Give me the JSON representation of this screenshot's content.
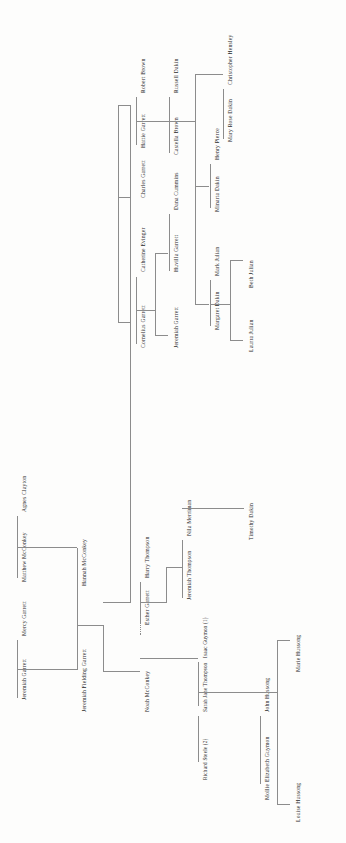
{
  "diagram": {
    "type": "genealogy-family-tree",
    "orientation": "rotated-90-ccw",
    "background_color": "#fdfdfc",
    "line_color": "#8c8c8c",
    "text_color": "#2b2b2b"
  },
  "people": {
    "jeremiah_garrett_sr": "Jeremiah Garrett",
    "mercy_garrett": "Mercy Garrett",
    "matthew_mcconkey": "Matthew  McConkey",
    "agnes_clayton": "Agnes Clayton",
    "jeremiah_fielding_garrett": "Jeremiah Fielding Garrett",
    "hannah_mcconkey": "Hannah McConkey",
    "noah_mcconkey": "Noah McConkey",
    "esther_garrett": "Esther Garrett",
    "harry_thompson": "Harry Thompson",
    "jeremiah_thompson": "Jeremiah Thompson",
    "nila_merriman": "Nila Merriman",
    "timothy_dakin": "Timothy Dakin",
    "richard_steele": "Richard Steele (2)",
    "sarah_jane_thompson": "Sarah Jane Thompson",
    "isaac_guymon": "Isaac Guymon (1)",
    "mollie_elizabeth_guymon": "Mollie Elizabeth Guymon",
    "john_hussong": "John Hussong",
    "louise_hussong": "Louise Hussong",
    "marie_hussong": "Marie Hussong",
    "cornelius_garrett": "Cornelius Garrett",
    "catherine_evinger": "Catherine Evinger",
    "charles_garrett": "Charles Garrett",
    "hattie_garrett": "Hattie Garrett",
    "robert_brown": "Robert Brown",
    "jeremiah_garrett_jr": "Jeremiah Garrett",
    "huvilla_garrett": "Huvilla Garrett",
    "dana_cummins": "Dana Cummins",
    "castella_brown": "Castella Brown",
    "russell_dakin": "Russell Dakin",
    "margaret_dakin": "Margaret Dakin",
    "mark_julian": "Mark Julian",
    "minarta_dakin": "Minarta Dakin",
    "henry_pierce": "Henry Pierce",
    "mary_rose_dakin": "Mary Rose Dakin",
    "christopher_hensley": "Christopher Hensley",
    "laurra_julian": "Laurra Julian",
    "beth_julian": "Beth Julian"
  },
  "unions": [
    {
      "a": "jeremiah_garrett_sr",
      "b": "mercy_garrett",
      "child": "jeremiah_fielding_garrett"
    },
    {
      "a": "matthew_mcconkey",
      "b": "agnes_clayton",
      "child": "hannah_mcconkey"
    },
    {
      "a": "jeremiah_fielding_garrett",
      "b": "hannah_mcconkey",
      "child": "esther_garrett"
    },
    {
      "a": "noah_mcconkey",
      "b": "esther_garrett",
      "relation": "dotted",
      "child": "sarah_jane_thompson"
    },
    {
      "a": "esther_garrett",
      "b": "harry_thompson",
      "child": "jeremiah_thompson"
    },
    {
      "a": "jeremiah_thompson",
      "b": "nila_merriman",
      "child": "timothy_dakin"
    },
    {
      "a": "sarah_jane_thompson",
      "b": "isaac_guymon",
      "child": "mollie_elizabeth_guymon"
    },
    {
      "a": "mollie_elizabeth_guymon",
      "b": "john_hussong",
      "children": [
        "louise_hussong",
        "marie_hussong"
      ]
    },
    {
      "a": "cornelius_garrett",
      "b": "catherine_evinger",
      "children": [
        "jeremiah_garrett_jr",
        "huvilla_garrett"
      ]
    },
    {
      "a": "huvilla_garrett",
      "b": "dana_cummins"
    },
    {
      "a": "castella_brown",
      "b": "russell_dakin",
      "children": [
        "margaret_dakin",
        "minarta_dakin",
        "mary_rose_dakin"
      ]
    },
    {
      "a": "hattie_garrett",
      "b": "robert_brown",
      "child": "castella_brown"
    },
    {
      "a": "margaret_dakin",
      "b": "mark_julian",
      "children": [
        "laurra_julian",
        "beth_julian"
      ]
    },
    {
      "a": "minarta_dakin",
      "b": "henry_pierce"
    },
    {
      "a": "mary_rose_dakin",
      "b": "christopher_hensley"
    }
  ],
  "sibling_groups": [
    {
      "name": "garrett-siblings",
      "members": [
        "cornelius_garrett",
        "charles_garrett",
        "hattie_garrett"
      ]
    }
  ]
}
